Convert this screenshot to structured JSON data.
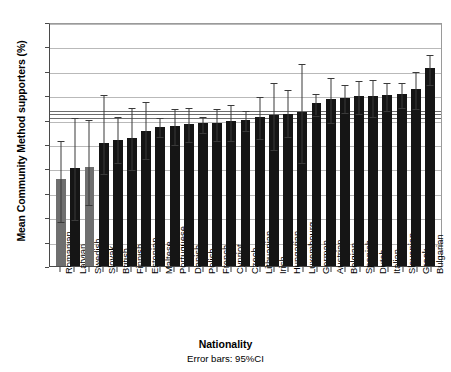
{
  "chart_data": {
    "type": "bar",
    "title": "",
    "xlabel": "Nationality",
    "ylabel": "Mean Community Method supporters (%)",
    "footnote": "Error bars: 95%CI",
    "ylim": [
      0,
      100
    ],
    "yticks": [
      0,
      10,
      20,
      30,
      40,
      50,
      60,
      70,
      80,
      90,
      100
    ],
    "grid": true,
    "legend": "none",
    "error_bar_type": "95%CI",
    "reference_lines": [
      61.5,
      63.0,
      64.5
    ],
    "bar_colors": {
      "default": "#151515",
      "highlight": "#6f6f6f"
    },
    "categories": [
      "Romanian",
      "Latvian",
      "Swedish",
      "Slovak",
      "British",
      "Finnish",
      "Estonian",
      "Maltese",
      "Portuguese",
      "Danish",
      "Polish",
      "French",
      "Cypriot",
      "Czech",
      "Lithuanian",
      "Irish",
      "Hungarian",
      "Luxembourg",
      "German",
      "Austrian",
      "Belgian",
      "Spanish",
      "Dutch",
      "Italian",
      "Slovenian",
      "Greek",
      "Bulgarian"
    ],
    "values": [
      35.5,
      40.0,
      40.5,
      50.5,
      51.5,
      52.5,
      55.5,
      57.0,
      57.5,
      58.0,
      58.5,
      58.5,
      59.5,
      60.0,
      61.0,
      62.0,
      62.5,
      63.0,
      67.0,
      68.5,
      69.0,
      69.5,
      69.5,
      70.0,
      70.5,
      72.5,
      81.0
    ],
    "ci_lower": [
      19.0,
      19.5,
      26.0,
      38.5,
      43.0,
      40.0,
      44.5,
      53.5,
      50.5,
      51.5,
      55.5,
      52.0,
      52.0,
      56.0,
      53.0,
      48.5,
      53.5,
      43.0,
      62.5,
      59.5,
      63.5,
      63.0,
      62.0,
      64.5,
      65.5,
      65.0,
      75.0
    ],
    "ci_upper": [
      52.0,
      61.5,
      60.5,
      71.0,
      62.0,
      65.5,
      68.0,
      61.5,
      65.0,
      65.5,
      62.0,
      65.0,
      67.0,
      64.5,
      70.0,
      76.0,
      73.0,
      83.5,
      71.5,
      78.0,
      75.0,
      76.5,
      77.0,
      76.0,
      76.0,
      80.5,
      87.5
    ],
    "gray_bars": [
      "Romanian",
      "Swedish"
    ]
  }
}
